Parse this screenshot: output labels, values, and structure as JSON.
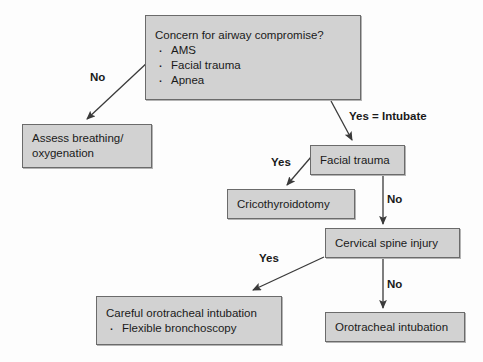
{
  "diagram": {
    "style": {
      "node_fill": "#d2d2d2",
      "node_border": "#6b6b6b",
      "background": "#fdfdfd",
      "text_color": "#1a1a1a",
      "edge_color": "#3a3a3a"
    },
    "nodes": [
      {
        "id": "concern",
        "title": "Concern for airway compromise?",
        "bullets": [
          "AMS",
          "Facial trauma",
          "Apnea"
        ]
      },
      {
        "id": "assess",
        "title": "Assess breathing/",
        "title_line2": "oxygenation",
        "bullets": []
      },
      {
        "id": "facial",
        "title": "Facial trauma",
        "bullets": []
      },
      {
        "id": "crico",
        "title": "Cricothyroidotomy",
        "bullets": []
      },
      {
        "id": "cspine",
        "title": "Cervical spine injury",
        "bullets": []
      },
      {
        "id": "careful",
        "title": "Careful orotracheal intubation",
        "bullets": [
          "Flexible bronchoscopy"
        ]
      },
      {
        "id": "oro",
        "title": "Orotracheal intubation",
        "bullets": []
      }
    ],
    "edges": [
      {
        "id": "no-1",
        "label": "No",
        "from": "concern",
        "to": "assess"
      },
      {
        "id": "yes-intub",
        "label": "Yes = Intubate",
        "from": "concern",
        "to": "facial"
      },
      {
        "id": "yes-1",
        "label": "Yes",
        "from": "facial",
        "to": "crico"
      },
      {
        "id": "no-2",
        "label": "No",
        "from": "facial",
        "to": "cspine"
      },
      {
        "id": "yes-2",
        "label": "Yes",
        "from": "cspine",
        "to": "careful"
      },
      {
        "id": "no-3",
        "label": "No",
        "from": "cspine",
        "to": "oro"
      }
    ]
  }
}
